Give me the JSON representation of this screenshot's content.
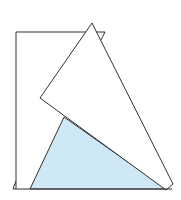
{
  "diagram": {
    "colors": {
      "stroke": "#333333",
      "shaded_fill": "#cfe8f5",
      "paper_fill": "#ffffff"
    },
    "shapes": {
      "rectangle_outline": "16,189 16,32 105,32",
      "rectangle_corner_tick": "105,32 101,40",
      "base_line": "13,189 172,189",
      "left_foot": "13,189 16,181",
      "shaded_triangle": "64,117 30,189 166,189",
      "folded_triangle": "92,23 40,98 166,190 173,184",
      "fold_line": "64,117 166,190"
    }
  }
}
